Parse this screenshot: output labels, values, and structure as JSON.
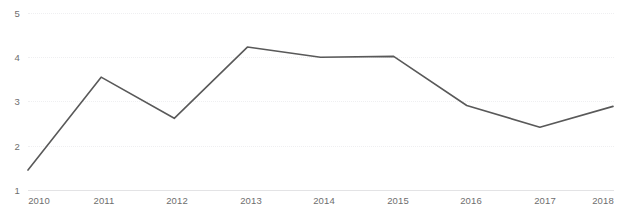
{
  "chart_data": {
    "type": "line",
    "title": "",
    "subtitle": "",
    "xlabel": "",
    "ylabel": "",
    "categories": [
      "2010",
      "2011",
      "2012",
      "2013",
      "2014",
      "2015",
      "2016",
      "2017",
      "2018"
    ],
    "x": [
      2010,
      2011,
      2012,
      2013,
      2014,
      2015,
      2016,
      2017,
      2018
    ],
    "values": [
      1.45,
      3.55,
      2.62,
      4.23,
      4.0,
      4.02,
      2.91,
      2.42,
      2.89
    ],
    "series": [
      {
        "name": "Series 1",
        "values": [
          1.45,
          3.55,
          2.62,
          4.23,
          4.0,
          4.02,
          2.91,
          2.42,
          2.89
        ],
        "color": "#595959"
      }
    ],
    "ylim": [
      1,
      5
    ],
    "xlim": [
      2010,
      2018
    ],
    "yticks": [
      1,
      2,
      3,
      4,
      5
    ],
    "ytick_labels": [
      "1",
      "2",
      "3",
      "4",
      "5"
    ],
    "xticks": [
      2010,
      2011,
      2012,
      2013,
      2014,
      2015,
      2016,
      2017,
      2018
    ],
    "grid": true,
    "grid_axis": "y",
    "grid_style": "dotted",
    "legend": false,
    "legend_position": "none",
    "markers": false,
    "line_width": 1.6,
    "colors": {
      "line": "#595959",
      "grid": "#efeff1",
      "axis": "#e3e3e5",
      "tick_label": "#6e6e6e",
      "background": "#ffffff"
    }
  },
  "axes": {
    "y_labels": [
      "5",
      "4",
      "3",
      "2",
      "1"
    ],
    "x_labels": [
      "2010",
      "2011",
      "2012",
      "2013",
      "2014",
      "2015",
      "2016",
      "2017",
      "2018"
    ]
  }
}
